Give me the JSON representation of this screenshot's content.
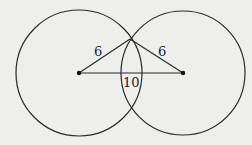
{
  "diagram": {
    "type": "geometry",
    "colors": {
      "background": "#eeeeec",
      "stroke": "#2a2a2a",
      "text": "#1e1e1e"
    },
    "circles": [
      {
        "id": "left",
        "cx": 79,
        "cy": 73,
        "r": 63
      },
      {
        "id": "right",
        "cx": 183,
        "cy": 73,
        "r": 62
      }
    ],
    "points": {
      "left_center": {
        "x": 79,
        "y": 73
      },
      "right_center": {
        "x": 183,
        "y": 73
      },
      "top_intersection": {
        "x": 130,
        "y": 39
      }
    },
    "labels": {
      "left_radius": "6",
      "right_radius": "6",
      "center_distance": "10"
    }
  }
}
